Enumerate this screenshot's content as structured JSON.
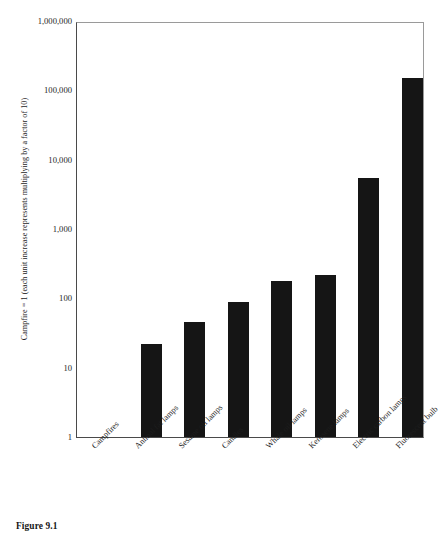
{
  "caption": "Figure 9.1",
  "chart_data": {
    "type": "bar",
    "title": "",
    "subtitle": "",
    "xlabel": "",
    "ylabel": "Campfire = 1 (each unit increase represents multiplying by a factor of 10)",
    "yscale": "log",
    "ylim": [
      1,
      1000000
    ],
    "ytick_labels": [
      "1",
      "10",
      "100",
      "1,000",
      "10,000",
      "100,000",
      "1,000,000"
    ],
    "ytick_values": [
      1,
      10,
      100,
      1000,
      10000,
      100000,
      1000000
    ],
    "grid": false,
    "legend": null,
    "categories": [
      "Campfires",
      "Animal fat lamps",
      "Sesame oil lamps",
      "Candles",
      "Whale oil lamps",
      "Kerosene lamps",
      "Electric carbon lamps",
      "Fluorescent bulb"
    ],
    "values": [
      1,
      22,
      45,
      90,
      180,
      215,
      5500,
      150000
    ],
    "bar_color": "#151515",
    "axis_color": "#4a4a4a"
  }
}
